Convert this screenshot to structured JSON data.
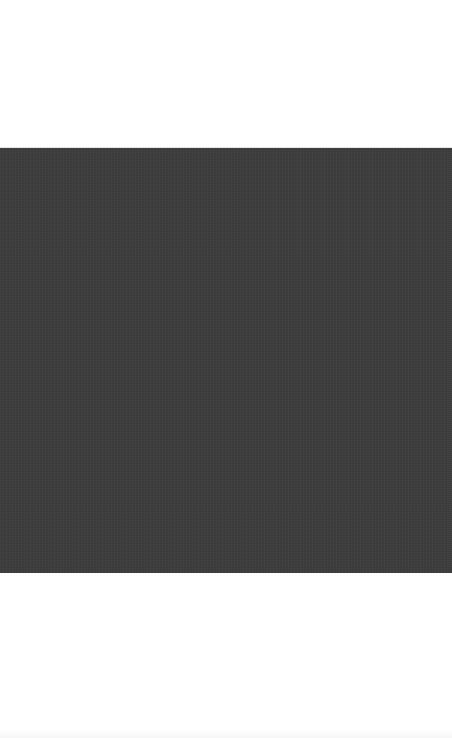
{
  "screen": {
    "status_text": "",
    "media": {
      "kind": "image-or-video-placeholder",
      "color": "#3c3c3c"
    },
    "background_color": "#ffffff"
  }
}
